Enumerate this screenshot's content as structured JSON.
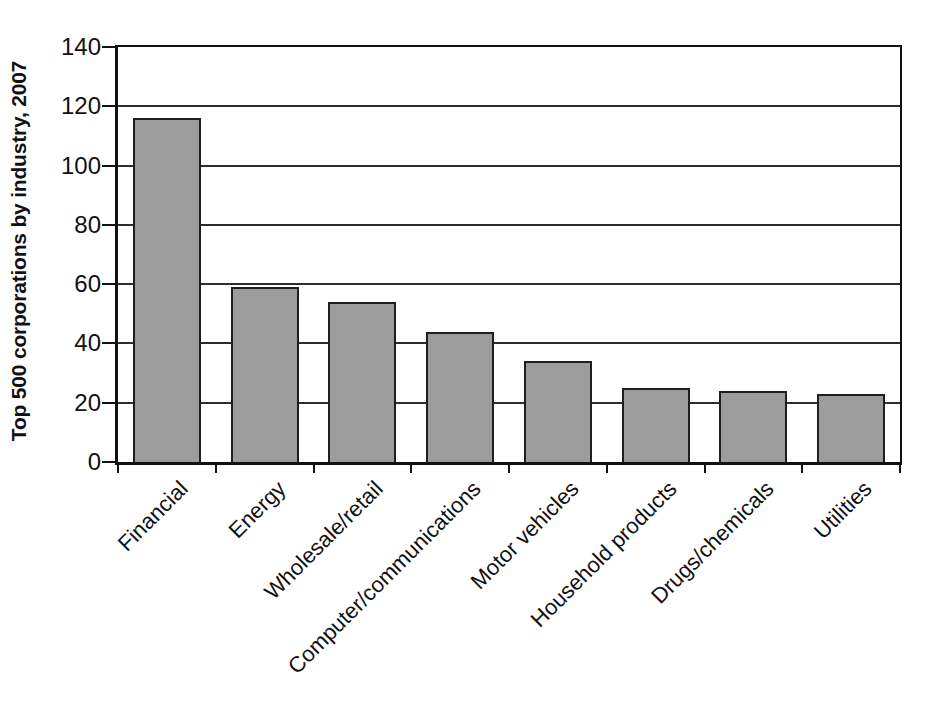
{
  "figure": {
    "background": "#ffffff",
    "axis_color": "#111111",
    "gridline_color": "#2e2e2e",
    "text_color": "#111111"
  },
  "chart_data": {
    "type": "bar",
    "title": "",
    "ylabel": "Top 500 corporations by industry, 2007",
    "xlabel": "",
    "categories": [
      "Financial",
      "Energy",
      "Wholesale/retail",
      "Computer/communications",
      "Motor vehicles",
      "Household products",
      "Drugs/chemicals",
      "Utilities"
    ],
    "values": [
      116,
      59,
      54,
      44,
      34,
      25,
      24,
      23
    ],
    "ylim": [
      0,
      140
    ],
    "yticks": [
      0,
      20,
      40,
      60,
      80,
      100,
      120,
      140
    ],
    "grid": "horizontal",
    "legend": "none",
    "bar_color": "#9c9c9c",
    "bar_border_color": "#1f1f1f"
  }
}
